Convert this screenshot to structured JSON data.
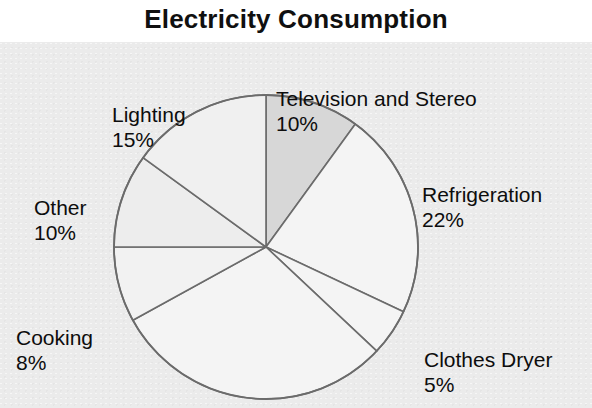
{
  "title": "Electricity Consumption",
  "chart_data": {
    "type": "pie",
    "title": "Electricity Consumption",
    "xlabel": "",
    "ylabel": "",
    "legend": "none",
    "grid": false,
    "labels_show_percent": true,
    "start_angle_deg": 0,
    "direction": "clockwise",
    "categories": [
      "Television and Stereo",
      "Refrigeration",
      "Clothes Dryer",
      "Other Appliances",
      "Cooking",
      "Other",
      "Lighting"
    ],
    "values": [
      10,
      22,
      5,
      30,
      8,
      10,
      15
    ],
    "units": "%",
    "slices": [
      {
        "name": "Television and Stereo",
        "value": 10,
        "percent_text": "10%",
        "label_text": "Television and Stereo",
        "labelled": true,
        "fill": "#d7d7d7",
        "stroke": "#6b6b6b",
        "start_deg": 0,
        "end_deg": 36
      },
      {
        "name": "Refrigeration",
        "value": 22,
        "percent_text": "22%",
        "label_text": "Refrigeration",
        "labelled": true,
        "fill": "#f4f4f4",
        "stroke": "#6b6b6b",
        "start_deg": 36,
        "end_deg": 115.2
      },
      {
        "name": "Clothes Dryer",
        "value": 5,
        "percent_text": "5%",
        "label_text": "Clothes Dryer",
        "labelled": true,
        "fill": "#f4f4f4",
        "stroke": "#6b6b6b",
        "start_deg": 115.2,
        "end_deg": 133.2
      },
      {
        "name": "Other Appliances",
        "value": 30,
        "percent_text": "",
        "label_text": "",
        "labelled": false,
        "fill": "#f4f4f4",
        "stroke": "#6b6b6b",
        "start_deg": 133.2,
        "end_deg": 241.2
      },
      {
        "name": "Cooking",
        "value": 8,
        "percent_text": "8%",
        "label_text": "Cooking",
        "labelled": true,
        "fill": "#f2f2f2",
        "stroke": "#6b6b6b",
        "start_deg": 241.2,
        "end_deg": 270
      },
      {
        "name": "Other",
        "value": 10,
        "percent_text": "10%",
        "label_text": "Other",
        "labelled": true,
        "fill": "#ededed",
        "stroke": "#6b6b6b",
        "start_deg": 270,
        "end_deg": 306
      },
      {
        "name": "Lighting",
        "value": 15,
        "percent_text": "15%",
        "label_text": "Lighting",
        "labelled": true,
        "fill": "#f0f0f0",
        "stroke": "#6b6b6b",
        "start_deg": 306,
        "end_deg": 360
      }
    ]
  },
  "labels": {
    "television": {
      "name": "Television and Stereo",
      "percent": "10%"
    },
    "refrigeration": {
      "name": "Refrigeration",
      "percent": "22%"
    },
    "clothes_dryer": {
      "name": "Clothes Dryer",
      "percent": "5%"
    },
    "cooking": {
      "name": "Cooking",
      "percent": "8%"
    },
    "other": {
      "name": "Other",
      "percent": "10%"
    },
    "lighting": {
      "name": "Lighting",
      "percent": "15%"
    }
  },
  "colors": {
    "title_text": "#101010",
    "label_text": "#0d0d0d",
    "plot_background": "#ebebeb",
    "page_background": "#ffffff",
    "slice_outline": "#6b6b6b",
    "highlight_slice": "#d7d7d7"
  },
  "geometry": {
    "center_x": 266,
    "center_y": 205,
    "radius": 152
  }
}
